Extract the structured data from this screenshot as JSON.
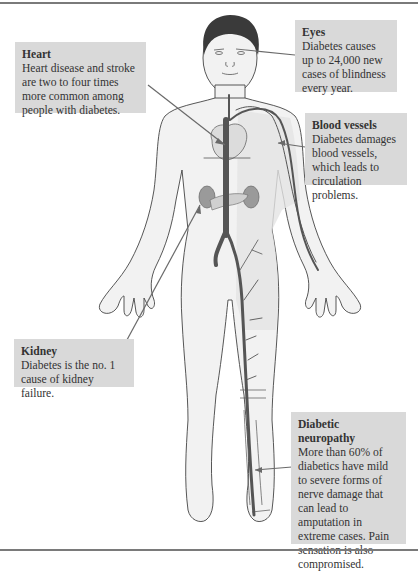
{
  "diagram": {
    "colors": {
      "callout_bg": "#d9d9d9",
      "skin_shade": "#e6e6e6",
      "vessel": "#555555",
      "organ": "#9a9a9a",
      "frame": "#7a7a7a"
    },
    "callouts": [
      {
        "id": "heart",
        "title": "Heart",
        "text": "Heart disease and stroke are two to four times more common among people with diabetes."
      },
      {
        "id": "eyes",
        "title": "Eyes",
        "text": "Diabetes causes up to 24,000 new cases of blindness every year."
      },
      {
        "id": "blood_vessels",
        "title": "Blood vessels",
        "text": "Diabetes damages blood vessels, which leads to circulation problems."
      },
      {
        "id": "kidney",
        "title": "Kidney",
        "text": "Diabetes is the no. 1 cause of kidney failure."
      },
      {
        "id": "neuropathy",
        "title": "Diabetic neuropathy",
        "text": "More than 60% of diabetics have mild to severe forms of nerve damage that can lead to amputation in extreme cases. Pain sensation is also compromised."
      }
    ]
  }
}
